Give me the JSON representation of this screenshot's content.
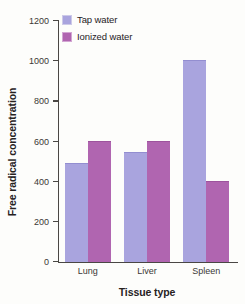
{
  "chart_data": {
    "type": "bar",
    "title": "",
    "subtitle": "",
    "xlabel": "Tissue type",
    "ylabel": "Free radical concentration",
    "categories": [
      "Lung",
      "Liver",
      "Spleen"
    ],
    "series": [
      {
        "name": "Tap water",
        "values": [
          490,
          545,
          1000
        ],
        "color": "#a9a4de"
      },
      {
        "name": "Ionized water",
        "values": [
          600,
          600,
          400
        ],
        "color": "#b065b0"
      }
    ],
    "ylim": [
      0,
      1200
    ],
    "yticks": [
      0,
      200,
      400,
      600,
      800,
      1000,
      1200
    ],
    "ytick_labels": [
      "0",
      "200",
      "400",
      "600",
      "800",
      "1000",
      "1200"
    ],
    "grid": false,
    "legend_position": "upper left",
    "annotations": []
  },
  "legend": {
    "items": [
      {
        "label": "Tap water",
        "swatch": "legend-swatch-tap-water"
      },
      {
        "label": "Ionized water",
        "swatch": "legend-swatch-ionized-water"
      }
    ]
  }
}
